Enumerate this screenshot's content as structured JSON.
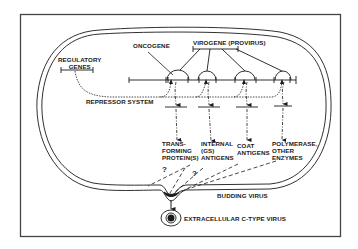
{
  "diagram": {
    "colors": {
      "ink": "#1a1a1a",
      "background": "#ffffff",
      "frame": "#444444"
    },
    "labels": {
      "regulatory_genes": "REGULATORY\nGENES",
      "oncogene": "ONCOGENE",
      "virogene": "VIROGENE (PROVIRUS)",
      "repressor_system": "REPRESSOR SYSTEM",
      "transforming_proteins": "TRANS-\nFORMING\nPROTEIN(S)",
      "internal_antigens": "INTERNAL\n(GS)\nANTIGENS",
      "coat_antigens": "COAT\nANTIGENS",
      "polymerase": "POLYMERASE,\nOTHER\nENZYMES",
      "budding_virus": "BUDDING VIRUS",
      "extracellular_virus": "EXTRACELLULAR C-TYPE VIRUS",
      "question_mark_1": "?",
      "question_mark_2": "?"
    },
    "nodes": [
      {
        "id": "regulatory-genes",
        "kind": "gene-segment"
      },
      {
        "id": "oncogene",
        "kind": "gene"
      },
      {
        "id": "virogene-provirus",
        "kind": "gene-group",
        "members": 4
      },
      {
        "id": "repressor-system",
        "kind": "regulatory-pathway",
        "style": "dotted"
      },
      {
        "id": "transforming-proteins",
        "kind": "product"
      },
      {
        "id": "internal-gs-antigens",
        "kind": "product"
      },
      {
        "id": "coat-antigens",
        "kind": "product"
      },
      {
        "id": "polymerase-other-enzymes",
        "kind": "product"
      },
      {
        "id": "budding-virus",
        "kind": "event"
      },
      {
        "id": "extracellular-c-type-virus",
        "kind": "particle"
      }
    ],
    "edges": [
      {
        "from": "regulatory-genes",
        "to": "repressor-system",
        "style": "dotted"
      },
      {
        "from": "repressor-system",
        "to": "oncogene",
        "style": "dotted"
      },
      {
        "from": "repressor-system",
        "to": "virogene-provirus",
        "style": "dotted"
      },
      {
        "from": "oncogene",
        "to": "transforming-proteins",
        "style": "dash-dot-arrow"
      },
      {
        "from": "virogene-provirus",
        "to": "internal-gs-antigens",
        "style": "dash-dot-arrow"
      },
      {
        "from": "virogene-provirus",
        "to": "coat-antigens",
        "style": "dash-dot-arrow"
      },
      {
        "from": "virogene-provirus",
        "to": "polymerase-other-enzymes",
        "style": "dash-dot-arrow"
      },
      {
        "from": "transforming-proteins",
        "to": "budding-virus",
        "style": "dashed",
        "label": "?"
      },
      {
        "from": "internal-gs-antigens",
        "to": "budding-virus",
        "style": "dashed"
      },
      {
        "from": "coat-antigens",
        "to": "budding-virus",
        "style": "dashed"
      },
      {
        "from": "polymerase-other-enzymes",
        "to": "budding-virus",
        "style": "dashed"
      },
      {
        "from": "budding-virus",
        "to": "extracellular-c-type-virus",
        "style": "solid-arrow"
      }
    ]
  }
}
